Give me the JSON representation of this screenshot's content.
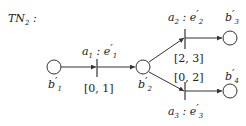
{
  "title": {
    "main": "TN",
    "sub": "2",
    "suffix": " :"
  },
  "places": [
    {
      "id": "b1",
      "label": "b",
      "prime": "′",
      "sub": "1",
      "cx": 54,
      "cy": 67
    },
    {
      "id": "b2",
      "label": "b",
      "prime": "′",
      "sub": "2",
      "cx": 143,
      "cy": 67
    },
    {
      "id": "b3",
      "label": "b",
      "prime": "′",
      "sub": "3",
      "cx": 230,
      "cy": 38
    },
    {
      "id": "b4",
      "label": "b",
      "prime": "′",
      "sub": "4",
      "cx": 230,
      "cy": 91
    }
  ],
  "transitions": [
    {
      "id": "t1",
      "action": "a",
      "action_sub": "1",
      "event": "e",
      "event_prime": "′",
      "event_sub": "1",
      "interval": "[0, 1]"
    },
    {
      "id": "t2",
      "action": "a",
      "action_sub": "2",
      "event": "e",
      "event_prime": "′",
      "event_sub": "2",
      "interval": "[2, 3]"
    },
    {
      "id": "t3",
      "action": "a",
      "action_sub": "3",
      "event": "e",
      "event_prime": "′",
      "event_sub": "3",
      "interval": "[0, 2]"
    }
  ],
  "colors": {
    "stroke": "#333333",
    "text": "#222222",
    "background": "#ffffff"
  }
}
